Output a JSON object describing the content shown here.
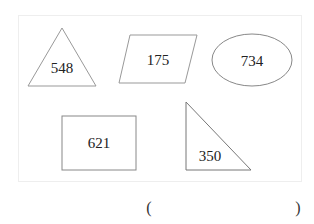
{
  "shapes": [
    {
      "id": "triangle",
      "type": "triangle",
      "label": "548"
    },
    {
      "id": "parallelogram",
      "type": "parallelogram",
      "label": "175"
    },
    {
      "id": "ellipse",
      "type": "ellipse",
      "label": "734"
    },
    {
      "id": "rectangle",
      "type": "rectangle",
      "label": "621"
    },
    {
      "id": "right-triangle",
      "type": "right-triangle",
      "label": "350"
    }
  ],
  "answer": {
    "open": "(",
    "close": ")",
    "value": ""
  },
  "colors": {
    "stroke": "#888888",
    "frame": "#eeeeee",
    "text": "#222222"
  }
}
